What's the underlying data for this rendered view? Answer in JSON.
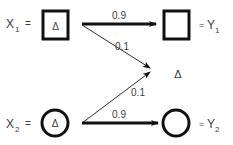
{
  "inputs": [
    {
      "label": "X",
      "subscript": "1",
      "equals": "=",
      "shape": "square",
      "inner_symbol": "Δ"
    },
    {
      "label": "X",
      "subscript": "2",
      "equals": "=",
      "shape": "circle",
      "inner_symbol": "Δ"
    }
  ],
  "outputs": [
    {
      "label": "Y",
      "subscript": "1",
      "equals": "=",
      "shape": "square"
    },
    {
      "label": "Y",
      "subscript": "2",
      "equals": "=",
      "shape": "circle"
    }
  ],
  "edges": [
    {
      "from": "X1",
      "to": "Y1",
      "weight": "0.9",
      "style": "thick"
    },
    {
      "from": "X1",
      "to": "delta",
      "weight": "0.1",
      "style": "thin"
    },
    {
      "from": "X2",
      "to": "delta",
      "weight": "0.1",
      "style": "thin"
    },
    {
      "from": "X2",
      "to": "Y2",
      "weight": "0.9",
      "style": "thick"
    }
  ],
  "delta_node": {
    "symbol": "Δ"
  },
  "colors": {
    "stroke": "#111111",
    "text": "#3a3a3a"
  }
}
